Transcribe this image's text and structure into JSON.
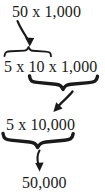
{
  "diagram": {
    "ink_color": "#1a1a1a",
    "background_color": "#ffffff",
    "steps": [
      {
        "id": "step-1",
        "text": "50 x 1,000"
      },
      {
        "id": "step-2",
        "text": "5 x 10 x 1,000"
      },
      {
        "id": "step-3",
        "text": "5 x 10,000"
      },
      {
        "id": "step-4",
        "text": "50,000"
      }
    ],
    "connectors": [
      {
        "id": "arrow-1",
        "icon": "curved-arrow-down-right-icon",
        "from_step": "step-1",
        "to_step": "step-2"
      },
      {
        "id": "brace-1",
        "icon": "curly-brace-up-icon",
        "spans_step": "step-2",
        "spans_text": "5 x 10"
      },
      {
        "id": "brace-2",
        "icon": "curly-brace-down-icon",
        "spans_step": "step-2",
        "spans_text": "10 x 1,000"
      },
      {
        "id": "arrow-2",
        "icon": "curved-arrow-down-left-icon",
        "from_step": "step-2",
        "to_step": "step-3"
      },
      {
        "id": "brace-3",
        "icon": "curly-brace-down-icon",
        "spans_step": "step-3",
        "spans_text": "5 x 10,000"
      },
      {
        "id": "arrow-3",
        "icon": "curved-arrow-down-icon",
        "from_step": "step-3",
        "to_step": "step-4"
      }
    ]
  }
}
